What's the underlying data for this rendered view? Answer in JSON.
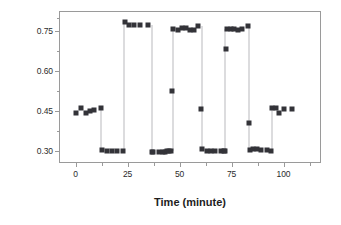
{
  "chart_data": {
    "type": "scatter",
    "title": "",
    "xlabel": "Time (minute)",
    "ylabel": "Ratios(Ru/OG)",
    "xlim": [
      -8,
      118
    ],
    "ylim": [
      0.255,
      0.825
    ],
    "xticks": [
      0,
      25,
      50,
      75,
      100
    ],
    "xtick_labels": [
      "0",
      "25",
      "50",
      "75",
      "100"
    ],
    "xticks_minor": [
      12.5,
      37.5,
      62.5,
      87.5,
      112.5
    ],
    "yticks": [
      0.3,
      0.45,
      0.6,
      0.75
    ],
    "ytick_labels": [
      "0.30",
      "0.45",
      "0.60",
      "0.75"
    ],
    "yticks_minor": [
      0.375,
      0.525,
      0.675,
      0.8
    ],
    "grid": false,
    "legend": false,
    "marker": "square",
    "marker_color": "#333338",
    "connector_color": "#b9b9bd",
    "series": [
      {
        "name": "Ratios(Ru/OG)",
        "x": [
          0,
          2.5,
          5,
          7,
          9,
          12,
          12.5,
          15,
          17.5,
          20,
          23,
          23.5,
          25.5,
          28,
          31,
          35,
          36.5,
          37,
          40,
          42,
          43,
          44,
          45,
          46,
          46.5,
          47,
          49,
          51,
          53,
          55,
          57,
          59,
          60.5,
          61,
          63,
          65,
          67,
          70,
          71.5,
          72,
          72.5,
          73,
          74.5,
          76,
          78,
          80,
          83,
          83.5,
          84,
          85.5,
          87,
          89,
          92,
          94,
          94.5,
          96.5,
          98,
          100,
          104
        ],
        "y": [
          0.443,
          0.462,
          0.442,
          0.45,
          0.452,
          0.462,
          0.303,
          0.299,
          0.3,
          0.3,
          0.301,
          0.782,
          0.772,
          0.773,
          0.772,
          0.772,
          0.298,
          0.298,
          0.297,
          0.297,
          0.298,
          0.299,
          0.3,
          0.3,
          0.525,
          0.757,
          0.753,
          0.76,
          0.763,
          0.752,
          0.752,
          0.767,
          0.458,
          0.306,
          0.3,
          0.3,
          0.3,
          0.301,
          0.3,
          0.301,
          0.681,
          0.757,
          0.759,
          0.756,
          0.755,
          0.757,
          0.767,
          0.404,
          0.305,
          0.308,
          0.306,
          0.305,
          0.304,
          0.3,
          0.462,
          0.46,
          0.443,
          0.459,
          0.459
        ]
      }
    ],
    "connectors": [
      {
        "x": 12.2,
        "y0": 0.462,
        "y1": 0.303
      },
      {
        "x": 23.2,
        "y0": 0.782,
        "y1": 0.301
      },
      {
        "x": 36.7,
        "y0": 0.772,
        "y1": 0.298
      },
      {
        "x": 46.7,
        "y0": 0.757,
        "y1": 0.3
      },
      {
        "x": 60.7,
        "y0": 0.767,
        "y1": 0.306
      },
      {
        "x": 71.8,
        "y0": 0.757,
        "y1": 0.301
      },
      {
        "x": 83.3,
        "y0": 0.767,
        "y1": 0.305
      },
      {
        "x": 94.2,
        "y0": 0.462,
        "y1": 0.3
      }
    ]
  }
}
